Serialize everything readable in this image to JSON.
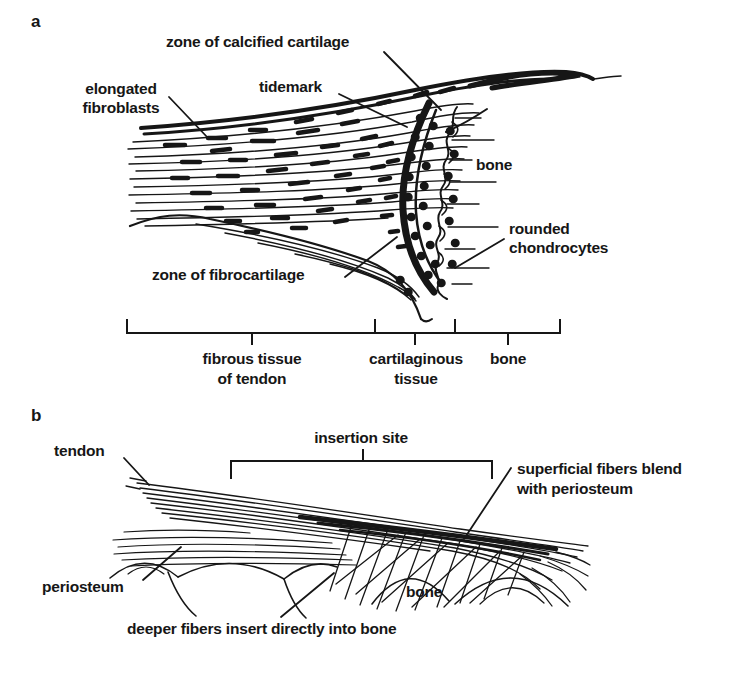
{
  "figure": {
    "background": "#ffffff",
    "ink_color": "#161616",
    "panel_a": {
      "letter": "a",
      "labels": {
        "zone_of_calcified_cartilage": "zone of calcified cartilage",
        "tidemark": "tidemark",
        "elongated_fibroblasts": "elongated\nfibroblasts",
        "bone": "bone",
        "rounded_chondrocytes": "rounded\nchondrocytes",
        "zone_of_fibrocartilage": "zone of fibrocartilage"
      },
      "region_scale": {
        "regions": [
          {
            "label": "fibrous tissue\nof tendon"
          },
          {
            "label": "cartilaginous\ntissue"
          },
          {
            "label": "bone"
          }
        ]
      }
    },
    "panel_b": {
      "letter": "b",
      "labels": {
        "tendon": "tendon",
        "insertion_site": "insertion site",
        "superficial_fibers": "superficial fibers blend\nwith periosteum",
        "periosteum": "periosteum",
        "bone": "bone",
        "deeper_fibers": "deeper fibers insert directly into bone"
      }
    }
  }
}
